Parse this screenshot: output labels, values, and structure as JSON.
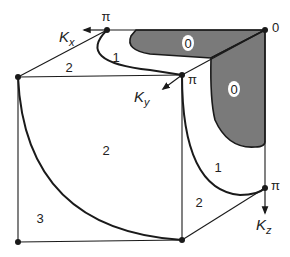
{
  "diagram": {
    "type": "brillouin-zone-cube",
    "colors": {
      "background": "#ffffff",
      "line": "#1a1a1a",
      "shaded_region": "#7a7a7a"
    },
    "axes": {
      "kx": {
        "label_main": "K",
        "label_sub": "x",
        "end_label": "π"
      },
      "ky": {
        "label_main": "K",
        "label_sub": "y",
        "end_label": "π"
      },
      "kz": {
        "label_main": "K",
        "label_sub": "z",
        "end_label": "π"
      },
      "origin_label": "0"
    },
    "regions": [
      {
        "id": "zone-0-top",
        "label": "0",
        "shaded": true
      },
      {
        "id": "zone-0-side",
        "label": "0",
        "shaded": true
      },
      {
        "id": "zone-1-top",
        "label": "1",
        "shaded": false
      },
      {
        "id": "zone-1-side",
        "label": "1",
        "shaded": false
      },
      {
        "id": "zone-2-top",
        "label": "2",
        "shaded": false
      },
      {
        "id": "zone-2-front",
        "label": "2",
        "shaded": false
      },
      {
        "id": "zone-2-side",
        "label": "2",
        "shaded": false
      },
      {
        "id": "zone-3-front",
        "label": "3",
        "shaded": false
      }
    ]
  }
}
